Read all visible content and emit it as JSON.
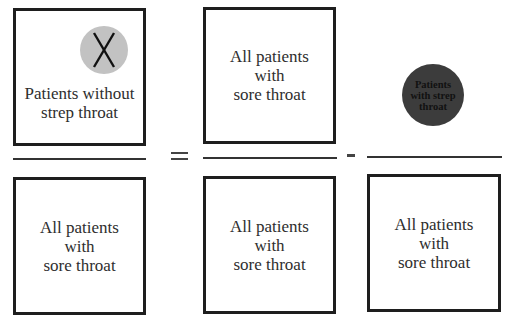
{
  "diagram": {
    "type": "fraction-equation",
    "numerators": {
      "left": {
        "label": "Patients without strep throat",
        "lines": [
          "Patients without",
          "strep throat"
        ],
        "icon": "x-in-circle-icon",
        "icon_glyph": "X",
        "icon_color": "#c2c2c2"
      },
      "middle": {
        "label": "All patients with sore throat",
        "lines": [
          "All patients",
          "with",
          "sore throat"
        ]
      },
      "right": {
        "label": "Patients with strep throat",
        "lines": [
          "Patients",
          "with strep",
          "throat"
        ],
        "shape": "circle",
        "fill_color": "#3c3c3c"
      }
    },
    "operators": {
      "equals": "=",
      "minus": "-"
    },
    "denominators": {
      "left": {
        "lines": [
          "All patients",
          "with",
          "sore throat"
        ]
      },
      "middle": {
        "lines": [
          "All patients",
          "with",
          "sore throat"
        ]
      },
      "right": {
        "lines": [
          "All patients",
          "with",
          "sore throat"
        ]
      }
    }
  }
}
